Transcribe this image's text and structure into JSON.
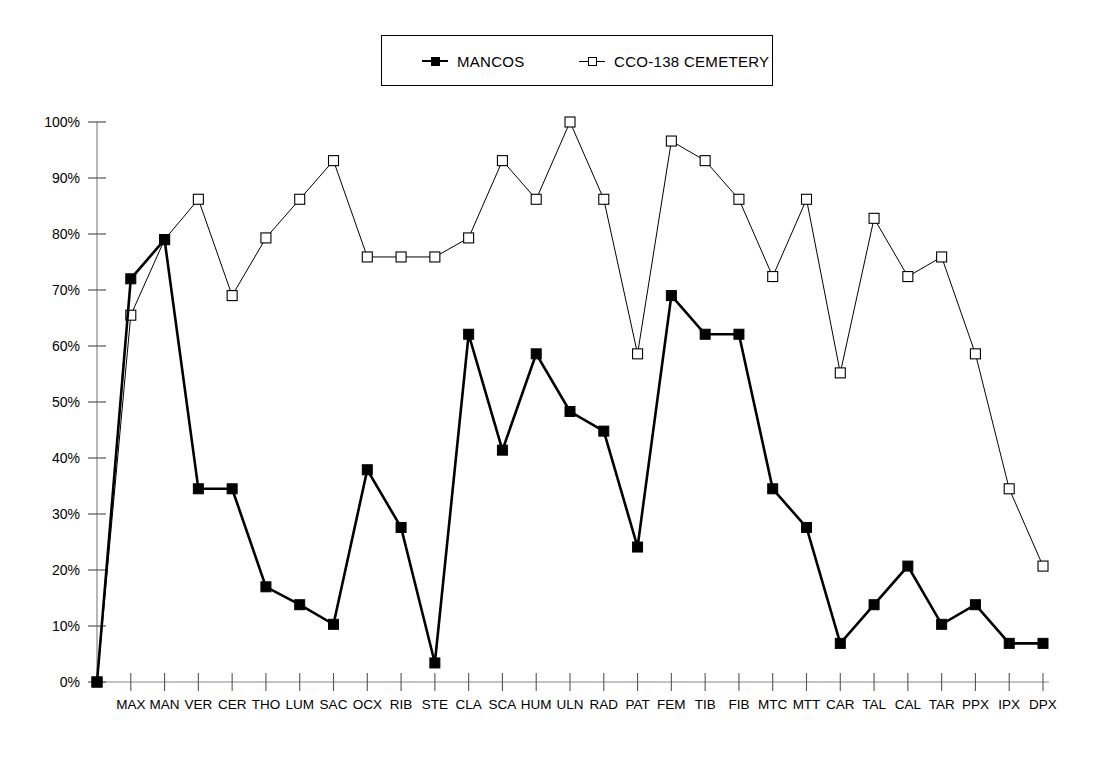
{
  "legend": {
    "series": [
      {
        "label": "MANCOS",
        "marker": "filled-square",
        "color": "#000000"
      },
      {
        "label": "CCO-138 CEMETERY",
        "marker": "open-square",
        "color": "#000000"
      }
    ]
  },
  "axes": {
    "y_tick_labels": [
      "0%",
      "10%",
      "20%",
      "30%",
      "40%",
      "50%",
      "60%",
      "70%",
      "80%",
      "90%",
      "100%"
    ],
    "x_tick_labels": [
      "MAX",
      "MAN",
      "VER",
      "CER",
      "THO",
      "LUM",
      "SAC",
      "OCX",
      "RIB",
      "STE",
      "CLA",
      "SCA",
      "HUM",
      "ULN",
      "RAD",
      "PAT",
      "FEM",
      "TIB",
      "FIB",
      "MTC",
      "MTT",
      "CAR",
      "TAL",
      "CAL",
      "TAR",
      "PPX",
      "IPX",
      "DPX"
    ]
  },
  "chart_data": {
    "type": "line",
    "title": "",
    "xlabel": "",
    "ylabel": "",
    "ylim": [
      0,
      100
    ],
    "yticks": [
      0,
      10,
      20,
      30,
      40,
      50,
      60,
      70,
      80,
      90,
      100
    ],
    "ytick_format": "percent",
    "grid": false,
    "legend_position": "top-center",
    "origin_point": {
      "x_index": -1,
      "mancos": 0,
      "cemetery": 0
    },
    "categories": [
      "MAX",
      "MAN",
      "VER",
      "CER",
      "THO",
      "LUM",
      "SAC",
      "OCX",
      "RIB",
      "STE",
      "CLA",
      "SCA",
      "HUM",
      "ULN",
      "RAD",
      "PAT",
      "FEM",
      "TIB",
      "FIB",
      "MTC",
      "MTT",
      "CAR",
      "TAL",
      "CAL",
      "TAR",
      "PPX",
      "IPX",
      "DPX"
    ],
    "series": [
      {
        "name": "MANCOS",
        "marker": "filled-square",
        "line_width": 2.6,
        "values": [
          72.0,
          79.0,
          34.5,
          34.5,
          17.0,
          13.8,
          10.3,
          37.9,
          27.6,
          3.4,
          62.1,
          41.4,
          58.6,
          48.3,
          44.8,
          24.1,
          69.0,
          62.1,
          62.1,
          34.5,
          27.6,
          6.9,
          13.8,
          20.7,
          10.3,
          13.8,
          6.9,
          6.9
        ]
      },
      {
        "name": "CCO-138 CEMETERY",
        "marker": "open-square",
        "line_width": 1.0,
        "values": [
          65.5,
          79.0,
          86.2,
          69.0,
          79.3,
          86.2,
          93.1,
          75.9,
          75.9,
          75.9,
          79.3,
          93.1,
          86.2,
          100.0,
          86.2,
          58.6,
          96.6,
          93.1,
          86.2,
          72.4,
          86.2,
          55.2,
          82.8,
          72.4,
          75.9,
          58.6,
          34.5,
          20.7
        ]
      }
    ]
  },
  "geometry": {
    "plot_left": 97,
    "plot_right": 1043,
    "plot_top": 122,
    "plot_bottom": 682
  }
}
